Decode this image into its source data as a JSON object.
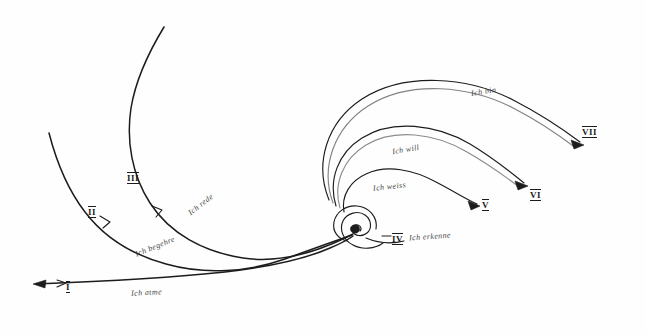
{
  "figure": {
    "ink_color": "#1c1c1c",
    "background_color": "#ffffff",
    "width": 646,
    "height": 335
  },
  "stages": [
    {
      "numeral": "I",
      "label": "Ich atme",
      "numeral_x": 66,
      "numeral_y": 281,
      "label_x": 131,
      "label_y": 288,
      "label_rotate": -3,
      "label_size": 8
    },
    {
      "numeral": "II",
      "label": "Ich begehre",
      "numeral_x": 88,
      "numeral_y": 206,
      "label_x": 134,
      "label_y": 242,
      "label_rotate": -22,
      "label_size": 8
    },
    {
      "numeral": "III",
      "label": "Ich rede",
      "numeral_x": 127,
      "numeral_y": 172,
      "label_x": 186,
      "label_y": 200,
      "label_rotate": -38,
      "label_size": 8
    },
    {
      "numeral": "IV",
      "label": "Ich erkenne",
      "numeral_x": 392,
      "numeral_y": 233,
      "label_x": 409,
      "label_y": 232,
      "label_rotate": -4,
      "label_size": 8
    },
    {
      "numeral": "V",
      "label": "Ich weiss",
      "numeral_x": 482,
      "numeral_y": 199,
      "label_x": 373,
      "label_y": 182,
      "label_rotate": -6,
      "label_size": 8
    },
    {
      "numeral": "VI",
      "label": "Ich will",
      "numeral_x": 530,
      "numeral_y": 189,
      "label_x": 392,
      "label_y": 145,
      "label_rotate": -10,
      "label_size": 8
    },
    {
      "numeral": "VII",
      "label": "Ich bin",
      "numeral_x": 582,
      "numeral_y": 126,
      "label_x": 471,
      "label_y": 87,
      "label_rotate": -9,
      "label_size": 8
    }
  ],
  "center": {
    "name": "spiral-core",
    "x": 352,
    "y": 234
  },
  "dash_marker": {
    "x": 385,
    "y": 235,
    "width": 9
  }
}
